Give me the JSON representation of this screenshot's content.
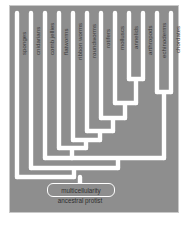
{
  "figure": {
    "kind": "cladogram",
    "panel_background": "#8e8e8e",
    "branch_color": "#ffffff",
    "label_color": "#3a3a3a"
  },
  "tips": [
    {
      "id": "sponges",
      "label": "sponges",
      "x": 17
    },
    {
      "id": "cnidarians",
      "label": "cnidarians",
      "x": 31
    },
    {
      "id": "comb-jellies",
      "label": "comb jellies",
      "x": 45
    },
    {
      "id": "flatworms",
      "label": "flatworms",
      "x": 59
    },
    {
      "id": "ribbon-worms",
      "label": "ribbon worms",
      "x": 73
    },
    {
      "id": "roundworms",
      "label": "roundworms",
      "x": 87
    },
    {
      "id": "rotifers",
      "label": "rotifers",
      "x": 101
    },
    {
      "id": "molluscs",
      "label": "molluscs",
      "x": 115
    },
    {
      "id": "annelids",
      "label": "annelids",
      "x": 129
    },
    {
      "id": "arthropods",
      "label": "arthropods",
      "x": 143
    },
    {
      "id": "echinoderms",
      "label": "echinoderms",
      "x": 157
    },
    {
      "id": "chordates",
      "label": "chordates",
      "x": 171
    }
  ],
  "nodes": [
    {
      "id": "annelids-arthropods",
      "children": [
        "annelids",
        "arthropods"
      ],
      "y": 79
    },
    {
      "id": "echinoderms-chordates",
      "children": [
        "echinoderms",
        "chordates"
      ],
      "y": 92
    },
    {
      "id": "lophotrochozoa",
      "children": [
        "molluscs",
        "annelids-arthropods"
      ],
      "y": 103
    },
    {
      "id": "protostomes",
      "children": [
        "rotifers",
        "lophotrochozoa"
      ],
      "y": 118
    },
    {
      "id": "bilateria-b",
      "children": [
        "roundworms",
        "protostomes"
      ],
      "y": 131
    },
    {
      "id": "bilateria-a",
      "children": [
        "ribbon worms",
        "bilateria-b"
      ],
      "y": 140
    },
    {
      "id": "bilateria",
      "children": [
        "flatworms",
        "bilateria-a"
      ],
      "y": 148
    },
    {
      "id": "eumetazoa",
      "children": [
        "bilateria",
        "echinoderms-chordates"
      ],
      "y": 158
    },
    {
      "id": "cnidaria-split",
      "children": [
        "comb jellies",
        "eumetazoa"
      ],
      "y": 150
    },
    {
      "id": "metazoa",
      "children": [
        "cnidarians",
        "cnidaria-split"
      ],
      "y": 168
    },
    {
      "id": "root",
      "children": [
        "sponges",
        "metazoa"
      ],
      "y": 177
    }
  ],
  "annotations": {
    "multicellularity": "multicellularity",
    "ancestral_protist": "ancestral protist"
  }
}
